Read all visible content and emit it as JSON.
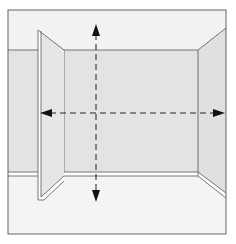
{
  "diagram": {
    "description": "Room interior line drawing with a protruding partition panel on the left and dashed measurement arrows",
    "colors": {
      "background": "#ffffff",
      "ceiling": "#f2f2f2",
      "floor": "#f4f4f4",
      "back_wall": "#e3e3e3",
      "side_wall": "#e0e0e0",
      "panel_front": "#e6e6e6",
      "baseboard": "#ffffff",
      "line": "#555555",
      "arrow": "#111111"
    },
    "elements": [
      {
        "name": "frame",
        "label": "Room frame"
      },
      {
        "name": "ceiling",
        "label": "Ceiling"
      },
      {
        "name": "back-wall",
        "label": "Back wall"
      },
      {
        "name": "left-wall",
        "label": "Left wall"
      },
      {
        "name": "right-wall",
        "label": "Right side wall"
      },
      {
        "name": "partition-panel",
        "label": "Protruding partition panel"
      },
      {
        "name": "baseboard",
        "label": "Baseboard trim"
      },
      {
        "name": "floor",
        "label": "Floor"
      }
    ],
    "arrows": [
      {
        "name": "vertical-measure-arrow",
        "direction": "vertical",
        "style": "dashed",
        "heads": "both"
      },
      {
        "name": "horizontal-measure-arrow",
        "direction": "horizontal",
        "style": "dashed",
        "heads": "both"
      }
    ]
  }
}
